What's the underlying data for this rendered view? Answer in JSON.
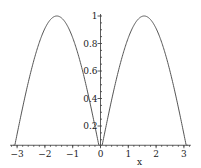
{
  "chart_data": {
    "type": "line",
    "title": "",
    "xlabel": "x",
    "ylabel": "",
    "function": "|sin(x)|",
    "xlim": [
      -3.14159,
      3.14159
    ],
    "ylim": [
      0.06,
      1.0
    ],
    "grid": false,
    "legend": null,
    "x_ticks": [
      "-3",
      "-2",
      "-1",
      "0",
      "1",
      "2",
      "3"
    ],
    "y_ticks": [
      "0.2",
      "0.4",
      "0.6",
      "0.8",
      "1"
    ],
    "series": [
      {
        "name": "|sin(x)|",
        "x": [
          -3.14,
          -2.5,
          -2.0,
          -1.57,
          -1.0,
          -0.5,
          0,
          0.5,
          1.0,
          1.57,
          2.0,
          2.5,
          3.14
        ],
        "values": [
          0.0,
          0.6,
          0.91,
          1.0,
          0.84,
          0.48,
          0.0,
          0.48,
          0.84,
          1.0,
          0.91,
          0.6,
          0.0
        ]
      }
    ],
    "color": "#555555"
  }
}
